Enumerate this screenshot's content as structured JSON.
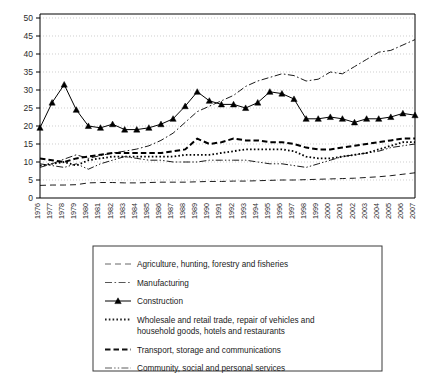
{
  "chart_data": {
    "type": "line",
    "title": "",
    "xlabel": "",
    "ylabel": "",
    "ylim": [
      0,
      50
    ],
    "ytick_step": 5,
    "yticks": [
      0,
      5,
      10,
      15,
      20,
      25,
      30,
      35,
      40,
      45,
      50
    ],
    "grid": true,
    "grid_style": "dotted horizontal",
    "legend_position": "below plot, boxed",
    "x": [
      1976,
      1977,
      1978,
      1979,
      1980,
      1981,
      1982,
      1983,
      1984,
      1985,
      1986,
      1987,
      1988,
      1989,
      1990,
      1991,
      1992,
      1993,
      1994,
      1995,
      1996,
      1997,
      1998,
      1999,
      2000,
      2001,
      2002,
      2003,
      2004,
      2005,
      2006,
      2007
    ],
    "categories": [
      "1976",
      "1977",
      "1978",
      "1979",
      "1980",
      "1981",
      "1982",
      "1983",
      "1984",
      "1985",
      "1986",
      "1987",
      "1988",
      "1989",
      "1990",
      "1991",
      "1992",
      "1993",
      "1994",
      "1995",
      "1996",
      "1997",
      "1998",
      "1999",
      "2000",
      "2001",
      "2002",
      "2003",
      "2004",
      "2005",
      "2006",
      "2007"
    ],
    "series": [
      {
        "name": "Agriculture, hunting, forestry and fisheries",
        "style": "dashed",
        "marker": "none",
        "color": "#555555",
        "values": [
          3.5,
          3.6,
          3.6,
          3.7,
          4.2,
          4.3,
          4.3,
          4.2,
          4.2,
          4.3,
          4.4,
          4.4,
          4.4,
          4.5,
          4.6,
          4.6,
          4.7,
          4.7,
          4.8,
          4.9,
          5.0,
          5.0,
          5.1,
          5.2,
          5.3,
          5.4,
          5.5,
          5.7,
          5.9,
          6.2,
          6.6,
          7.0
        ]
      },
      {
        "name": "Manufacturing",
        "style": "dash-dot",
        "marker": "none",
        "color": "#444444",
        "values": [
          8.5,
          9.5,
          10.8,
          12.0,
          11.0,
          11.8,
          12.5,
          13.0,
          13.6,
          14.5,
          16.0,
          18.0,
          21.0,
          24.0,
          25.5,
          27.0,
          28.5,
          31.0,
          32.5,
          33.5,
          34.5,
          34.0,
          32.5,
          33.0,
          35.0,
          34.5,
          36.5,
          38.5,
          40.5,
          41.0,
          42.5,
          44.0
        ]
      },
      {
        "name": "Construction",
        "style": "solid",
        "marker": "triangle",
        "color": "#000000",
        "values": [
          19.5,
          26.5,
          31.5,
          24.5,
          20.0,
          19.5,
          20.5,
          19.0,
          19.0,
          19.5,
          20.5,
          22.0,
          25.5,
          29.5,
          27.0,
          26.0,
          26.0,
          25.0,
          26.5,
          29.5,
          29.0,
          27.5,
          22.0,
          22.0,
          22.5,
          22.0,
          21.0,
          22.0,
          22.0,
          22.5,
          23.5,
          23.0
        ]
      },
      {
        "name": "Wholesale and retail trade, repair of vehicles and household goods, hotels and restaurants",
        "style": "dotted",
        "marker": "none",
        "color": "#222222",
        "values": [
          9.0,
          9.5,
          10.0,
          9.0,
          10.5,
          11.0,
          11.5,
          11.5,
          11.5,
          11.5,
          11.5,
          11.5,
          12.0,
          12.0,
          12.0,
          12.5,
          13.0,
          13.5,
          13.5,
          13.5,
          13.5,
          13.0,
          11.5,
          11.0,
          11.0,
          11.5,
          12.0,
          12.5,
          13.5,
          14.5,
          15.5,
          15.5
        ]
      },
      {
        "name": "Transport, storage and communications",
        "style": "bold-dashed",
        "marker": "none",
        "color": "#111111",
        "values": [
          11.0,
          10.5,
          10.0,
          11.0,
          11.5,
          12.0,
          12.5,
          12.5,
          12.5,
          12.5,
          12.5,
          13.0,
          13.5,
          16.5,
          15.0,
          15.5,
          16.5,
          16.0,
          16.0,
          15.5,
          15.5,
          15.0,
          14.0,
          13.5,
          13.5,
          14.0,
          14.5,
          15.0,
          15.5,
          16.0,
          16.5,
          16.5
        ]
      },
      {
        "name": "Community, social and personal services",
        "style": "dash-dot-dot",
        "marker": "none",
        "color": "#4a4a4a",
        "values": [
          9.5,
          9.0,
          8.5,
          9.5,
          8.0,
          9.5,
          10.5,
          11.5,
          11.0,
          10.5,
          10.5,
          10.0,
          10.0,
          10.0,
          10.5,
          10.5,
          10.5,
          10.5,
          10.0,
          9.5,
          9.5,
          9.0,
          8.5,
          9.5,
          10.5,
          11.5,
          12.0,
          12.5,
          13.0,
          14.0,
          14.5,
          15.0
        ]
      }
    ]
  },
  "legend": {
    "items": [
      {
        "label": "Agriculture, hunting, forestry and fisheries",
        "style": "dashed"
      },
      {
        "label": "Manufacturing",
        "style": "dash-dot"
      },
      {
        "label": "Construction",
        "style": "solid-marker"
      },
      {
        "label": "Wholesale and retail trade, repair of vehicles and",
        "label2": "household goods, hotels and restaurants",
        "style": "dotted"
      },
      {
        "label": "Transport, storage and communications",
        "style": "bold-dashed"
      },
      {
        "label": "Community, social and personal services",
        "style": "dash-dot-dot"
      }
    ]
  }
}
